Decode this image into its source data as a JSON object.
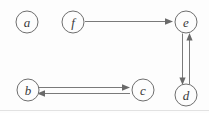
{
  "diagram": {
    "type": "directed-graph",
    "title": "",
    "background_color": "#fdfdfd",
    "node_stroke_color": "#6e6e6e",
    "edge_color": "#7a7a7a",
    "label_color": "#3a3a3a",
    "nodes": [
      {
        "id": "a",
        "label": "a",
        "cx": 27,
        "cy": 22,
        "r": 11
      },
      {
        "id": "f",
        "label": "f",
        "cx": 73,
        "cy": 22,
        "r": 11
      },
      {
        "id": "e",
        "label": "e",
        "cx": 186,
        "cy": 22,
        "r": 11
      },
      {
        "id": "b",
        "label": "b",
        "cx": 28,
        "cy": 90,
        "r": 11
      },
      {
        "id": "c",
        "label": "c",
        "cx": 143,
        "cy": 90,
        "r": 11
      },
      {
        "id": "d",
        "label": "d",
        "cx": 186,
        "cy": 95,
        "r": 11
      }
    ],
    "edges": [
      {
        "from": "f",
        "to": "e",
        "direction": "right",
        "label": ""
      },
      {
        "from": "e",
        "to": "d",
        "direction": "down",
        "label": ""
      },
      {
        "from": "d",
        "to": "e",
        "direction": "up",
        "label": ""
      },
      {
        "from": "b",
        "to": "c",
        "direction": "right",
        "label": ""
      },
      {
        "from": "c",
        "to": "b",
        "direction": "left",
        "label": ""
      }
    ]
  }
}
